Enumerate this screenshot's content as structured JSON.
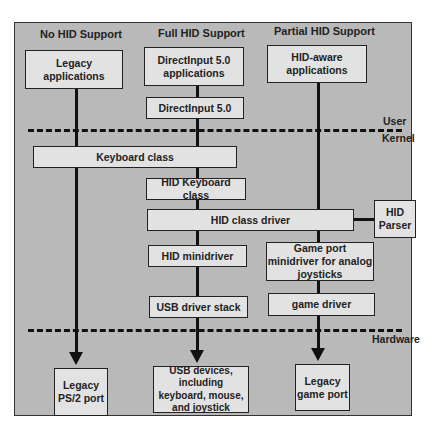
{
  "columns": {
    "no_hid": "No HID Support",
    "full_hid": "Full HID Support",
    "partial_hid": "Partial HID Support"
  },
  "boxes": {
    "legacy_apps": "Legacy applications",
    "directinput_apps": "DirectInput 5.0 applications",
    "hid_aware_apps": "HID-aware applications",
    "directinput": "DirectInput 5.0",
    "keyboard_class": "Keyboard class",
    "hid_keyboard_class": "HID Keyboard class",
    "hid_class_driver": "HID class driver",
    "hid_parser": "HID Parser",
    "hid_minidriver": "HID minidriver",
    "game_port_minidriver": "Game port minidriver for analog joysticks",
    "usb_driver_stack": "USB driver stack",
    "game_driver": "game driver",
    "legacy_ps2": "Legacy PS/2 port",
    "usb_devices": "USB devices, including keyboard, mouse, and joystick",
    "legacy_game_port": "Legacy game port"
  },
  "boundaries": {
    "user": "User",
    "kernel": "Kernel",
    "hardware": "Hardware"
  },
  "colors": {
    "background": "#b9b9b9",
    "box_fill": "#e2e2e2",
    "line": "#111111"
  }
}
